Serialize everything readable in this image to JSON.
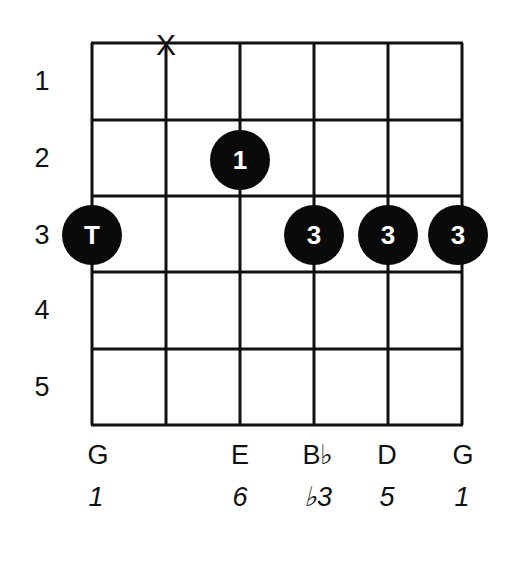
{
  "diagram": {
    "type": "guitar-chord-diagram",
    "frets_shown": [
      "1",
      "2",
      "3",
      "4",
      "5"
    ],
    "strings": 6,
    "muted_marker": "X",
    "muted_string_index": 1,
    "dots": [
      {
        "string": 0,
        "fret": 3,
        "label": "T"
      },
      {
        "string": 2,
        "fret": 2,
        "label": "1"
      },
      {
        "string": 3,
        "fret": 3,
        "label": "3"
      },
      {
        "string": 4,
        "fret": 3,
        "label": "3"
      },
      {
        "string": 5,
        "fret": 3,
        "label": "3"
      }
    ],
    "notes": [
      {
        "string": 0,
        "label": "G"
      },
      {
        "string": 2,
        "label": "E"
      },
      {
        "string": 3,
        "label": "B♭"
      },
      {
        "string": 4,
        "label": "D"
      },
      {
        "string": 5,
        "label": "G"
      }
    ],
    "intervals": [
      {
        "string": 0,
        "label": "1"
      },
      {
        "string": 2,
        "label": "6"
      },
      {
        "string": 3,
        "label": "♭3"
      },
      {
        "string": 4,
        "label": "5"
      },
      {
        "string": 5,
        "label": "1"
      }
    ],
    "colors": {
      "line": "#111111",
      "dot": "#0a0a0a",
      "dot_text": "#ffffff",
      "background": "#ffffff"
    }
  }
}
